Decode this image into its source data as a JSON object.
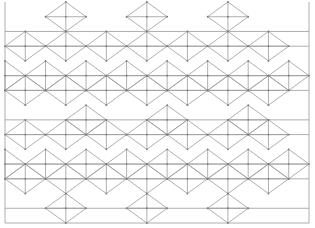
{
  "colors": {
    "line": "#9a9a9a",
    "vertex": "#7a7a7a",
    "background": "#ffffff"
  },
  "grid": {
    "columns": 15,
    "rows": 15
  },
  "frame": {
    "col_from": 0,
    "col_to": 15,
    "row_from": 0,
    "row_to": 15
  },
  "horizontal_lines": [
    {
      "row": 5,
      "from": 0,
      "to": 15
    },
    {
      "row": 6,
      "from": 0,
      "to": 15
    },
    {
      "row": 8,
      "from": 0,
      "to": 15
    },
    {
      "row": 9,
      "from": 0,
      "to": 15
    },
    {
      "row": 11,
      "from": 0,
      "to": 15
    },
    {
      "row": 12,
      "from": 0,
      "to": 15
    },
    {
      "row": 14,
      "from": 0,
      "to": 15
    },
    {
      "row": 2,
      "from": 0,
      "to": 15
    },
    {
      "row": 3,
      "from": 0,
      "to": 15
    }
  ],
  "diamonds": [
    {
      "col": 3,
      "row": 1
    },
    {
      "col": 7,
      "row": 1
    },
    {
      "col": 11,
      "row": 1
    },
    {
      "col": 1,
      "row": 3
    },
    {
      "col": 3,
      "row": 3
    },
    {
      "col": 5,
      "row": 3
    },
    {
      "col": 7,
      "row": 3
    },
    {
      "col": 9,
      "row": 3
    },
    {
      "col": 11,
      "row": 3
    },
    {
      "col": 13,
      "row": 3
    },
    {
      "col": 0,
      "row": 5
    },
    {
      "col": 2,
      "row": 5
    },
    {
      "col": 4,
      "row": 5
    },
    {
      "col": 6,
      "row": 5
    },
    {
      "col": 8,
      "row": 5
    },
    {
      "col": 10,
      "row": 5
    },
    {
      "col": 12,
      "row": 5
    },
    {
      "col": 14,
      "row": 5
    },
    {
      "col": 1,
      "row": 6
    },
    {
      "col": 3,
      "row": 6
    },
    {
      "col": 5,
      "row": 6
    },
    {
      "col": 7,
      "row": 6
    },
    {
      "col": 9,
      "row": 6
    },
    {
      "col": 11,
      "row": 6
    },
    {
      "col": 13,
      "row": 6
    },
    {
      "col": 4,
      "row": 8
    },
    {
      "col": 8,
      "row": 8
    },
    {
      "col": 12,
      "row": 8
    },
    {
      "col": 1,
      "row": 9
    },
    {
      "col": 3,
      "row": 9
    },
    {
      "col": 5,
      "row": 9
    },
    {
      "col": 7,
      "row": 9
    },
    {
      "col": 9,
      "row": 9
    },
    {
      "col": 11,
      "row": 9
    },
    {
      "col": 13,
      "row": 9
    },
    {
      "col": 0,
      "row": 11
    },
    {
      "col": 2,
      "row": 11
    },
    {
      "col": 4,
      "row": 11
    },
    {
      "col": 6,
      "row": 11
    },
    {
      "col": 8,
      "row": 11
    },
    {
      "col": 10,
      "row": 11
    },
    {
      "col": 12,
      "row": 11
    },
    {
      "col": 14,
      "row": 11
    },
    {
      "col": 1,
      "row": 12
    },
    {
      "col": 3,
      "row": 12
    },
    {
      "col": 5,
      "row": 12
    },
    {
      "col": 7,
      "row": 12
    },
    {
      "col": 9,
      "row": 12
    },
    {
      "col": 11,
      "row": 12
    },
    {
      "col": 13,
      "row": 12
    },
    {
      "col": 3,
      "row": 14
    },
    {
      "col": 7,
      "row": 14
    },
    {
      "col": 11,
      "row": 14
    }
  ]
}
